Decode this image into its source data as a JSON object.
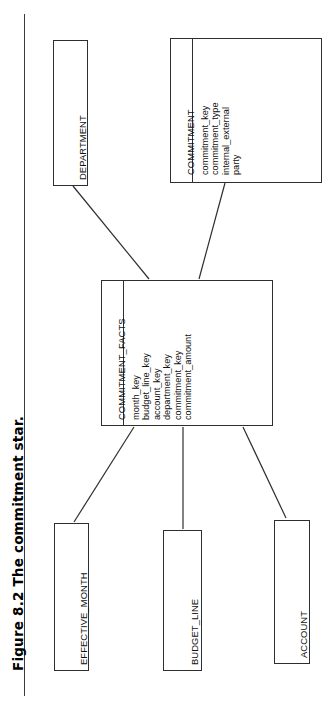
{
  "figure": {
    "caption": "Figure 8.2 The commitment star.",
    "orientation": "rotated-90-ccw",
    "ink_color": "#2e2e2e",
    "page_background": "#ffffff"
  },
  "diagram": {
    "type": "star-schema-er-diagram",
    "fact_table": {
      "name": "COMMITMENT_FACTS",
      "attributes": [
        "month_key",
        "budget_line_key",
        "account_key",
        "department_key",
        "commitment_key",
        "commitment_amount"
      ]
    },
    "dimensions": [
      {
        "name": "DEPARTMENT",
        "attributes": []
      },
      {
        "name": "COMMITMENT",
        "attributes": [
          "commitment_key",
          "commitment_type",
          "internal_external",
          "party"
        ]
      },
      {
        "name": "EFFECTIVE_MONTH",
        "attributes": []
      },
      {
        "name": "BUDGET_LINE",
        "attributes": []
      },
      {
        "name": "ACCOUNT",
        "attributes": []
      }
    ],
    "relationships": [
      {
        "from": "DEPARTMENT",
        "to": "COMMITMENT_FACTS"
      },
      {
        "from": "COMMITMENT",
        "to": "COMMITMENT_FACTS"
      },
      {
        "from": "COMMITMENT_FACTS",
        "to": "EFFECTIVE_MONTH"
      },
      {
        "from": "COMMITMENT_FACTS",
        "to": "BUDGET_LINE"
      },
      {
        "from": "COMMITMENT_FACTS",
        "to": "ACCOUNT"
      }
    ]
  }
}
